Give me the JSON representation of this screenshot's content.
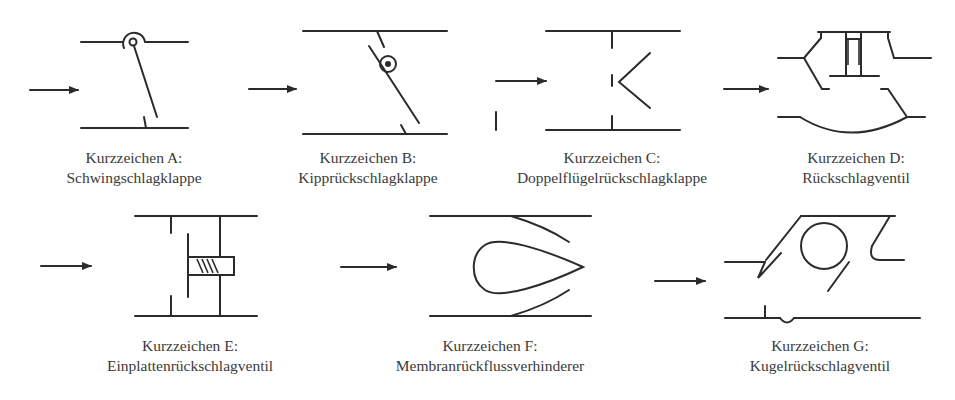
{
  "figure": {
    "symbols": [
      {
        "id": "A",
        "label": "Kurzzeichen A:",
        "name": "Schwingschlagklappe"
      },
      {
        "id": "B",
        "label": "Kurzzeichen B:",
        "name": "Kipprückschlagklappe"
      },
      {
        "id": "C",
        "label": "Kurzzeichen C:",
        "name": "Doppelflügelrückschlagklappe"
      },
      {
        "id": "D",
        "label": "Kurzzeichen D:",
        "name": "Rückschlagventil"
      },
      {
        "id": "E",
        "label": "Kurzzeichen E:",
        "name": "Einplattenrückschlagventil"
      },
      {
        "id": "F",
        "label": "Kurzzeichen F:",
        "name": "Membranrückflussverhinderer"
      },
      {
        "id": "G",
        "label": "Kurzzeichen G:",
        "name": "Kugelrückschlagventil"
      }
    ],
    "colors": {
      "line": "#2b2b2b",
      "text": "#3a3a3a",
      "background": "#ffffff"
    }
  }
}
